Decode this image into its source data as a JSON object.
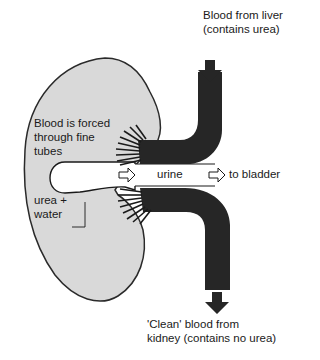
{
  "diagram": {
    "labels": {
      "blood_in_line1": "Blood from liver",
      "blood_in_line2": "(contains urea)",
      "forced_line1": "Blood is forced",
      "forced_line2": "through fine",
      "forced_line3": "tubes",
      "urea_line1": "urea +",
      "urea_line2": "water",
      "urine": "urine",
      "to_bladder": "to bladder",
      "blood_out_line1": "'Clean' blood from",
      "blood_out_line2": "kidney (contains no urea)"
    },
    "colors": {
      "kidney_fill": "#d9d9d9",
      "outline": "#2a2a2a",
      "vessel": "#262626",
      "background": "#ffffff"
    }
  }
}
